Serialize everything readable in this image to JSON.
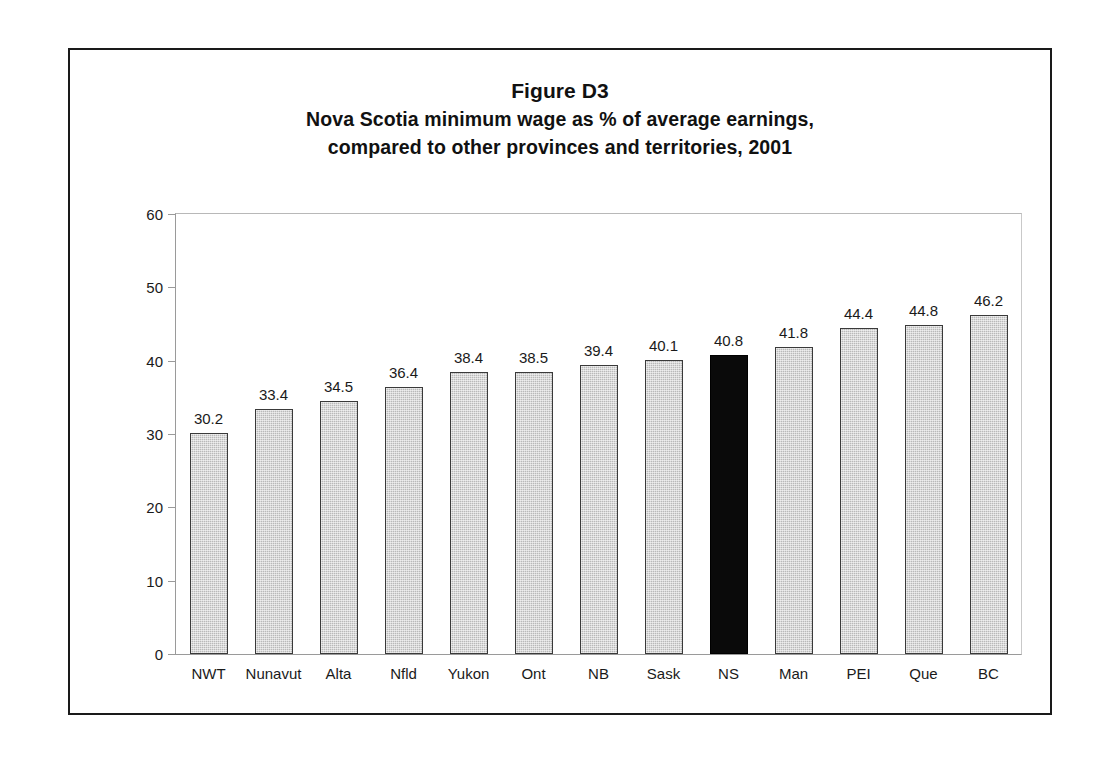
{
  "figure": {
    "title_line_1": "Figure D3",
    "title_line_2": "Nova Scotia minimum wage as % of average earnings,",
    "title_line_3": "compared to other provinces and territories, 2001"
  },
  "colors": {
    "bar_fill": "#b9b9b9",
    "bar_outline": "#3a3a3a",
    "highlight_fill": "#0a0a0a",
    "frame": "#1a1a1a",
    "axis": "#9a9a9a",
    "text": "#1a1a1a"
  },
  "chart_data": {
    "type": "bar",
    "xlabel": "",
    "ylabel": "",
    "ylim": [
      0,
      60
    ],
    "yticks": [
      0,
      10,
      20,
      30,
      40,
      50,
      60
    ],
    "ytick_labels": [
      "0",
      "10",
      "20",
      "30",
      "40",
      "50",
      "60"
    ],
    "grid": false,
    "legend": false,
    "highlight_category": "NS",
    "categories": [
      "NWT",
      "Nunavut",
      "Alta",
      "Nfld",
      "Yukon",
      "Ont",
      "NB",
      "Sask",
      "NS",
      "Man",
      "PEI",
      "Que",
      "BC"
    ],
    "values": [
      30.2,
      33.4,
      34.5,
      36.4,
      38.4,
      38.5,
      39.4,
      40.1,
      40.8,
      41.8,
      44.4,
      44.8,
      46.2
    ],
    "value_labels": [
      "30.2",
      "33.4",
      "34.5",
      "36.4",
      "38.4",
      "38.5",
      "39.4",
      "40.1",
      "40.8",
      "41.8",
      "44.4",
      "44.8",
      "46.2"
    ]
  }
}
